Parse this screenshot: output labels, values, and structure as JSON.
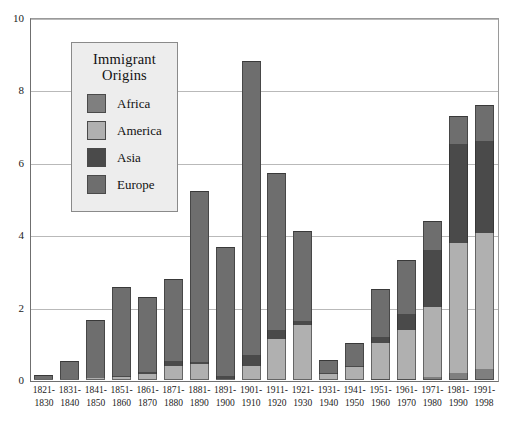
{
  "chart_data": {
    "type": "bar",
    "subtype": "stacked-bar",
    "title": "",
    "xlabel": "",
    "ylabel": "",
    "ylim": [
      0,
      10
    ],
    "yticks": [
      0,
      2,
      4,
      6,
      8,
      10
    ],
    "ytick_labels": [
      "0",
      "2",
      "4",
      "6",
      "8",
      "10"
    ],
    "grid": "horizontal",
    "units_note": "millions of immigrants",
    "legend": {
      "title_line1": "Immigrant",
      "title_line2": "Origins",
      "position": "inside-upper-left",
      "entries": [
        {
          "name": "Africa",
          "color": "#7f7f7f"
        },
        {
          "name": "America",
          "color": "#b0b0b0"
        },
        {
          "name": "Asia",
          "color": "#4a4a4a"
        },
        {
          "name": "Europe",
          "color": "#6e6e6e"
        }
      ]
    },
    "categories": [
      "1821-1830",
      "1831-1840",
      "1841-1850",
      "1851-1860",
      "1861-1870",
      "1871-1880",
      "1881-1890",
      "1891-1900",
      "1901-1910",
      "1911-1920",
      "1921-1930",
      "1931-1940",
      "1941-1950",
      "1951-1960",
      "1961-1970",
      "1971-1980",
      "1981-1990",
      "1991-1998"
    ],
    "category_labels": [
      [
        "1821-",
        "1830"
      ],
      [
        "1831-",
        "1840"
      ],
      [
        "1841-",
        "1850"
      ],
      [
        "1851-",
        "1860"
      ],
      [
        "1861-",
        "1870"
      ],
      [
        "1871-",
        "1880"
      ],
      [
        "1881-",
        "1890"
      ],
      [
        "1891-",
        "1900"
      ],
      [
        "1901-",
        "1910"
      ],
      [
        "1911-",
        "1920"
      ],
      [
        "1921-",
        "1930"
      ],
      [
        "1931-",
        "1940"
      ],
      [
        "1941-",
        "1950"
      ],
      [
        "1951-",
        "1960"
      ],
      [
        "1961-",
        "1970"
      ],
      [
        "1971-",
        "1980"
      ],
      [
        "1981-",
        "1990"
      ],
      [
        "1991-",
        "1998"
      ]
    ],
    "stack_order_bottom_to_top": [
      "Africa",
      "America",
      "Asia",
      "Europe"
    ],
    "series": [
      {
        "name": "Africa",
        "color": "#7f7f7f",
        "values": [
          0.0,
          0.0,
          0.0,
          0.0,
          0.0,
          0.0,
          0.0,
          0.0,
          0.0,
          0.0,
          0.0,
          0.0,
          0.0,
          0.01,
          0.03,
          0.08,
          0.18,
          0.3
        ]
      },
      {
        "name": "America",
        "color": "#b0b0b0",
        "values": [
          0.01,
          0.03,
          0.06,
          0.07,
          0.17,
          0.4,
          0.43,
          0.04,
          0.38,
          1.14,
          1.52,
          0.16,
          0.35,
          1.0,
          1.35,
          1.93,
          3.6,
          3.75
        ]
      },
      {
        "name": "Asia",
        "color": "#4a4a4a",
        "values": [
          0.0,
          0.0,
          0.0,
          0.04,
          0.06,
          0.12,
          0.06,
          0.07,
          0.32,
          0.25,
          0.11,
          0.02,
          0.04,
          0.15,
          0.43,
          1.59,
          2.74,
          2.55
        ]
      },
      {
        "name": "Europe",
        "color": "#6e6e6e",
        "values": [
          0.1,
          0.5,
          1.6,
          2.45,
          2.05,
          2.27,
          4.74,
          3.56,
          8.1,
          4.32,
          2.48,
          0.35,
          0.62,
          1.33,
          1.5,
          0.8,
          0.76,
          1.0
        ]
      }
    ],
    "totals": [
      0.11,
      0.53,
      1.66,
      2.56,
      2.28,
      2.79,
      5.23,
      3.67,
      8.8,
      5.71,
      4.11,
      0.53,
      1.01,
      2.49,
      3.31,
      4.4,
      7.28,
      7.6
    ]
  }
}
